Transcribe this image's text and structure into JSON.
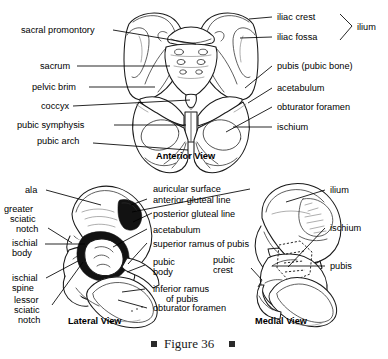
{
  "figure": {
    "caption": "Figure 36",
    "bullet": "square-bullet"
  },
  "views": [
    {
      "id": "anterior",
      "caption": "Anterior View",
      "labels_left": [
        {
          "key": "sacral_promontory",
          "text": "sacral promontory"
        },
        {
          "key": "sacrum",
          "text": "sacrum"
        },
        {
          "key": "pelvic_brim",
          "text": "pelvic brim"
        },
        {
          "key": "coccyx",
          "text": "coccyx"
        },
        {
          "key": "pubic_symphysis",
          "text": "pubic symphysis"
        },
        {
          "key": "pubic_arch",
          "text": "pubic arch"
        }
      ],
      "labels_right": [
        {
          "key": "iliac_crest",
          "text": "iliac crest"
        },
        {
          "key": "iliac_fossa",
          "text": "iliac fossa"
        },
        {
          "key": "ilium",
          "text": "ilium"
        },
        {
          "key": "pubis",
          "text": "pubis (pubic bone)"
        },
        {
          "key": "acetabulum",
          "text": "acetabulum"
        },
        {
          "key": "obturator_foramen",
          "text": "obturator foramen"
        },
        {
          "key": "ischium",
          "text": "ischium"
        }
      ]
    },
    {
      "id": "lateral",
      "caption": "Lateral View",
      "labels_left": [
        {
          "key": "ala",
          "text": "ala"
        },
        {
          "key": "greater_sciatic_notch",
          "text": "greater\nsciatic\nnotch",
          "lines": [
            "greater",
            "sciatic",
            "notch"
          ]
        },
        {
          "key": "ischial_body",
          "text": "ischial\nbody",
          "lines": [
            "ischial",
            "body"
          ]
        },
        {
          "key": "ischial_spine",
          "text": "ischial\nspine",
          "lines": [
            "ischial",
            "spine"
          ]
        },
        {
          "key": "lessor_sciatic_notch",
          "text": "lessor\nsciatic\nnotch",
          "lines": [
            "lessor",
            "sciatic",
            "notch"
          ]
        }
      ],
      "labels_center": [
        {
          "key": "auricular_surface",
          "text": "auricular surface"
        },
        {
          "key": "anterior_gluteal_line",
          "text": "anterior gluteal line"
        },
        {
          "key": "posterior_gluteal_line",
          "text": "posterior gluteal line"
        },
        {
          "key": "acetabulum",
          "text": "acetabulum"
        },
        {
          "key": "superior_ramus_of_pubis",
          "text": "superior ramus of pubis"
        },
        {
          "key": "pubic_body",
          "text": "pubic\nbody",
          "lines": [
            "pubic",
            "body"
          ]
        },
        {
          "key": "inferior_ramus_of_pubis",
          "text": "inferior ramus\n   of pubis",
          "lines": [
            "inferior ramus",
            "of pubis"
          ]
        },
        {
          "key": "obturator_foramen",
          "text": "obturator foramen"
        }
      ]
    },
    {
      "id": "medial",
      "caption": "Medial View",
      "labels_left": [
        {
          "key": "pubic_crest",
          "text": "pubic\ncrest",
          "lines": [
            "pubic",
            "crest"
          ]
        }
      ],
      "labels_right": [
        {
          "key": "ilium",
          "text": "ilium"
        },
        {
          "key": "ischium",
          "text": "ischium"
        },
        {
          "key": "pubis",
          "text": "pubis"
        }
      ]
    }
  ],
  "colors": {
    "ink": "#000000",
    "bone_outline": "#1a1a1a",
    "background": "#ffffff",
    "caption_ink": "#1a1a1a"
  }
}
